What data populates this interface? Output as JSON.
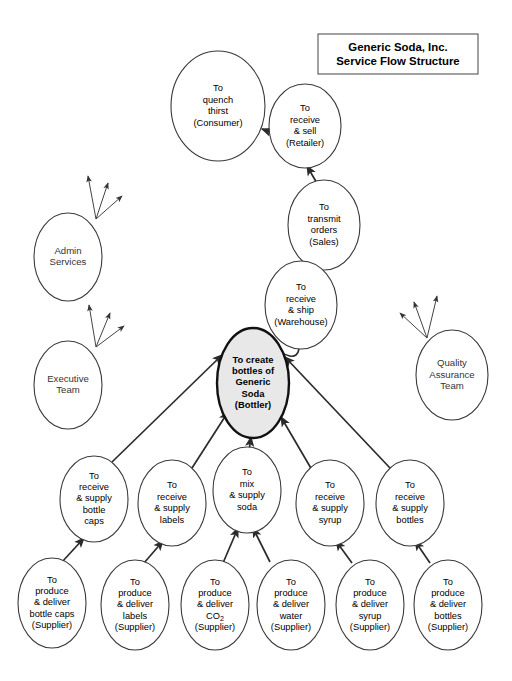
{
  "canvas": {
    "width": 512,
    "height": 681,
    "background": "#ffffff",
    "line_color": "#2b2b2b",
    "node_fill": "#ffffff",
    "node_stroke": "#3a3a3a",
    "focus_fill": "#e8e8e8",
    "focus_stroke": "#111111"
  },
  "title": {
    "line1": "Generic Soda, Inc.",
    "line2": "Service Flow Structure"
  },
  "chart_data": {
    "type": "diagram",
    "title": "Generic Soda, Inc. Service Flow Structure",
    "nodes": [
      {
        "id": "consumer",
        "cx": 218,
        "cy": 106,
        "rx": 47,
        "ry": 55,
        "focus": false,
        "lines": [
          "To",
          "quench",
          "thirst",
          "(Consumer)"
        ]
      },
      {
        "id": "retailer",
        "cx": 305,
        "cy": 126,
        "rx": 36,
        "ry": 42,
        "focus": false,
        "lines": [
          "To",
          "receive",
          "& sell",
          "(Retailer)"
        ]
      },
      {
        "id": "sales",
        "cx": 324,
        "cy": 225,
        "rx": 36,
        "ry": 45,
        "focus": false,
        "lines": [
          "To",
          "transmit",
          "orders",
          "(Sales)"
        ]
      },
      {
        "id": "warehouse",
        "cx": 301,
        "cy": 305,
        "rx": 36,
        "ry": 44,
        "focus": false,
        "lines": [
          "To",
          "receive",
          "& ship",
          "(Warehouse)"
        ]
      },
      {
        "id": "bottler",
        "cx": 253,
        "cy": 383,
        "rx": 36,
        "ry": 55,
        "focus": true,
        "lines": [
          "To create",
          "bottles of",
          "Generic",
          "Soda",
          "(Bottler)"
        ]
      },
      {
        "id": "admin",
        "cx": 68,
        "cy": 257,
        "rx": 34,
        "ry": 44,
        "focus": false,
        "lines": [
          "Admin",
          "Services"
        ]
      },
      {
        "id": "executive",
        "cx": 68,
        "cy": 385,
        "rx": 34,
        "ry": 44,
        "focus": false,
        "lines": [
          "Executive",
          "Team"
        ]
      },
      {
        "id": "quality",
        "cx": 452,
        "cy": 375,
        "rx": 36,
        "ry": 45,
        "focus": false,
        "lines": [
          "Quality",
          "Assurance",
          "Team"
        ]
      },
      {
        "id": "supply_caps",
        "cx": 94,
        "cy": 499,
        "rx": 34,
        "ry": 43,
        "focus": false,
        "lines": [
          "To",
          "receive",
          "& supply",
          "bottle",
          "caps"
        ]
      },
      {
        "id": "supply_labels",
        "cx": 172,
        "cy": 503,
        "rx": 34,
        "ry": 43,
        "focus": false,
        "lines": [
          "To",
          "receive",
          "& supply",
          "labels"
        ]
      },
      {
        "id": "mix_soda",
        "cx": 247,
        "cy": 490,
        "rx": 34,
        "ry": 43,
        "focus": false,
        "lines": [
          "To",
          "mix",
          "& supply",
          "soda"
        ]
      },
      {
        "id": "supply_syrup",
        "cx": 330,
        "cy": 503,
        "rx": 34,
        "ry": 43,
        "focus": false,
        "lines": [
          "To",
          "receive",
          "& supply",
          "syrup"
        ]
      },
      {
        "id": "supply_bottles",
        "cx": 410,
        "cy": 503,
        "rx": 34,
        "ry": 43,
        "focus": false,
        "lines": [
          "To",
          "receive",
          "& supply",
          "bottles"
        ]
      },
      {
        "id": "prod_caps",
        "cx": 52,
        "cy": 603,
        "rx": 34,
        "ry": 45,
        "focus": false,
        "lines": [
          "To",
          "produce",
          "& deliver",
          "bottle caps",
          "(Supplier)"
        ]
      },
      {
        "id": "prod_labels",
        "cx": 135,
        "cy": 605,
        "rx": 34,
        "ry": 45,
        "focus": false,
        "lines": [
          "To",
          "produce",
          "& deliver",
          "labels",
          "(Supplier)"
        ]
      },
      {
        "id": "prod_co2",
        "cx": 215,
        "cy": 605,
        "rx": 34,
        "ry": 45,
        "focus": false,
        "lines": [
          "To",
          "produce",
          "& deliver",
          "CO2",
          "(Supplier)"
        ],
        "subscript_line": 3
      },
      {
        "id": "prod_water",
        "cx": 291,
        "cy": 605,
        "rx": 34,
        "ry": 45,
        "focus": false,
        "lines": [
          "To",
          "produce",
          "& deliver",
          "water",
          "(Supplier)"
        ]
      },
      {
        "id": "prod_syrup",
        "cx": 370,
        "cy": 605,
        "rx": 34,
        "ry": 45,
        "focus": false,
        "lines": [
          "To",
          "produce",
          "& deliver",
          "syrup",
          "(Supplier)"
        ]
      },
      {
        "id": "prod_bottles",
        "cx": 448,
        "cy": 605,
        "rx": 34,
        "ry": 45,
        "focus": false,
        "lines": [
          "To",
          "produce",
          "& deliver",
          "bottles",
          "(Supplier)"
        ]
      }
    ],
    "edges": [
      {
        "from": "retailer",
        "to": "consumer",
        "x1": 287,
        "y1": 138,
        "x2": 262,
        "y2": 129
      },
      {
        "from": "sales",
        "to": "retailer",
        "x1": 318,
        "y1": 185,
        "x2": 307,
        "y2": 166
      },
      {
        "from": "warehouse",
        "to": "sales",
        "x1": 306,
        "y1": 266,
        "x2": 315,
        "y2": 258
      },
      {
        "from": "bottler",
        "to": "warehouse",
        "x1": 299,
        "y1": 349,
        "x2": 268,
        "y2": 343,
        "curved": true,
        "cx": 296,
        "cy": 366
      },
      {
        "from": "supply_caps",
        "to": "bottler",
        "x1": 112,
        "y1": 462,
        "x2": 222,
        "y2": 355
      },
      {
        "from": "supply_labels",
        "to": "bottler",
        "x1": 192,
        "y1": 468,
        "x2": 228,
        "y2": 412
      },
      {
        "from": "mix_soda",
        "to": "bottler",
        "x1": 249,
        "y1": 451,
        "x2": 251,
        "y2": 437
      },
      {
        "from": "supply_syrup",
        "to": "bottler",
        "x1": 312,
        "y1": 470,
        "x2": 281,
        "y2": 417
      },
      {
        "from": "supply_bottles",
        "to": "bottler",
        "x1": 390,
        "y1": 468,
        "x2": 285,
        "y2": 357
      },
      {
        "from": "prod_caps",
        "to": "supply_caps",
        "x1": 62,
        "y1": 562,
        "x2": 84,
        "y2": 538
      },
      {
        "from": "prod_labels",
        "to": "supply_labels",
        "x1": 144,
        "y1": 563,
        "x2": 163,
        "y2": 541
      },
      {
        "from": "prod_co2",
        "to": "mix_soda",
        "x1": 223,
        "y1": 563,
        "x2": 238,
        "y2": 528
      },
      {
        "from": "prod_water",
        "to": "mix_soda",
        "x1": 270,
        "y1": 562,
        "x2": 253,
        "y2": 528
      },
      {
        "from": "prod_syrup",
        "to": "supply_syrup",
        "x1": 352,
        "y1": 563,
        "x2": 336,
        "y2": 541
      },
      {
        "from": "prod_bottles",
        "to": "supply_bottles",
        "x1": 430,
        "y1": 563,
        "x2": 415,
        "y2": 541
      }
    ],
    "support_fans": [
      {
        "id": "admin-fan",
        "origin_x": 96,
        "origin_y": 219,
        "rays": [
          {
            "x": 88,
            "y": 176
          },
          {
            "x": 108,
            "y": 183
          },
          {
            "x": 122,
            "y": 196
          }
        ]
      },
      {
        "id": "executive-fan",
        "origin_x": 96,
        "origin_y": 347,
        "rays": [
          {
            "x": 89,
            "y": 305
          },
          {
            "x": 110,
            "y": 313
          },
          {
            "x": 124,
            "y": 326
          }
        ]
      },
      {
        "id": "quality-fan",
        "origin_x": 427,
        "origin_y": 338,
        "rays": [
          {
            "x": 437,
            "y": 296
          },
          {
            "x": 414,
            "y": 302
          },
          {
            "x": 400,
            "y": 313
          }
        ]
      }
    ]
  }
}
